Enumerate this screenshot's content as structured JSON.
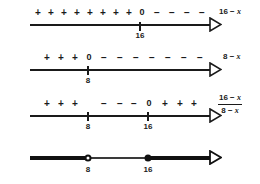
{
  "figure": {
    "axis_color": "#1a1a1a",
    "rows": [
      {
        "id": "row-16-minus-x",
        "expression_text": "16 − ",
        "expression_var": "x",
        "ticks": [
          {
            "label": "16",
            "x": 140
          }
        ],
        "zero_marks": [
          {
            "text": "0",
            "x": 140
          }
        ],
        "signs": [
          {
            "text": "+",
            "x": 38
          },
          {
            "text": "+",
            "x": 51
          },
          {
            "text": "+",
            "x": 64
          },
          {
            "text": "+",
            "x": 77
          },
          {
            "text": "+",
            "x": 90
          },
          {
            "text": "+",
            "x": 103
          },
          {
            "text": "+",
            "x": 116
          },
          {
            "text": "+",
            "x": 129
          },
          {
            "text": "−",
            "x": 155
          },
          {
            "text": "−",
            "x": 170
          },
          {
            "text": "−",
            "x": 185
          },
          {
            "text": "−",
            "x": 200
          }
        ]
      },
      {
        "id": "row-8-minus-x",
        "expression_text": "8 − ",
        "expression_var": "x",
        "ticks": [
          {
            "label": "8",
            "x": 88
          }
        ],
        "zero_marks": [
          {
            "text": "0",
            "x": 88
          }
        ],
        "signs": [
          {
            "text": "+",
            "x": 47
          },
          {
            "text": "+",
            "x": 61
          },
          {
            "text": "+",
            "x": 75
          },
          {
            "text": "−",
            "x": 104
          },
          {
            "text": "−",
            "x": 120
          },
          {
            "text": "−",
            "x": 136
          },
          {
            "text": "−",
            "x": 152
          },
          {
            "text": "−",
            "x": 168
          },
          {
            "text": "−",
            "x": 184
          },
          {
            "text": "−",
            "x": 200
          }
        ]
      },
      {
        "id": "row-quotient",
        "fraction_numerator_text": "16 − ",
        "fraction_numerator_var": "x",
        "fraction_denominator_text": "8 − ",
        "fraction_denominator_var": "x",
        "ticks": [
          {
            "label": "8",
            "x": 88
          },
          {
            "label": "16",
            "x": 148
          }
        ],
        "zero_marks": [
          {
            "text": "0",
            "x": 148
          }
        ],
        "signs": [
          {
            "text": "+",
            "x": 47
          },
          {
            "text": "+",
            "x": 61
          },
          {
            "text": "+",
            "x": 75
          },
          {
            "text": "−",
            "x": 104
          },
          {
            "text": "−",
            "x": 120
          },
          {
            "text": "−",
            "x": 134
          },
          {
            "text": "+",
            "x": 165
          },
          {
            "text": "+",
            "x": 180
          },
          {
            "text": "+",
            "x": 194
          }
        ]
      }
    ],
    "solution_row": {
      "id": "row-solution",
      "points": [
        {
          "label": "8",
          "x": 88,
          "type": "open"
        },
        {
          "label": "16",
          "x": 148,
          "type": "filled"
        }
      ],
      "segments": [
        {
          "from": 30,
          "to": 88,
          "weight": "bold"
        },
        {
          "from": 88,
          "to": 148,
          "weight": "light"
        },
        {
          "from": 148,
          "to": 210,
          "weight": "bold"
        }
      ]
    }
  }
}
